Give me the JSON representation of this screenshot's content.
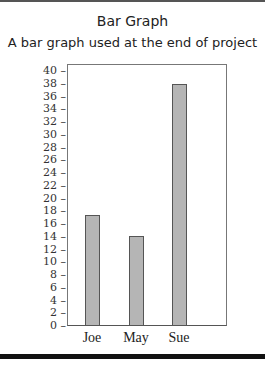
{
  "title": "Bar Graph",
  "subtitle": "A bar graph used at the end of project",
  "chart_data": {
    "type": "bar",
    "title": "Bar Graph",
    "subtitle": "A bar graph used at the end of project",
    "categories": [
      "Joe",
      "May",
      "Sue"
    ],
    "values": [
      17.3,
      13.9,
      37.8
    ],
    "xlabel": "",
    "ylabel": "",
    "ylim": [
      0,
      40
    ],
    "yticks": [
      0,
      2,
      4,
      6,
      8,
      10,
      12,
      14,
      16,
      18,
      20,
      22,
      24,
      26,
      28,
      30,
      32,
      34,
      36,
      38,
      40
    ],
    "grid": false,
    "legend": null,
    "bar_color": "#b5b5b5"
  }
}
